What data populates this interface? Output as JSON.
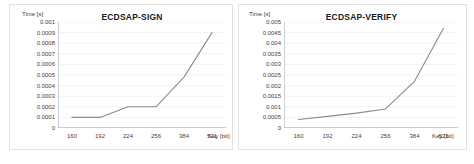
{
  "chart_data": [
    {
      "id": "ecdsap-sign",
      "type": "line",
      "title": "ECDSAP-SIGN",
      "xlabel": "Key [bit]",
      "ylabel": "Time [s]",
      "x_categories": [
        "160",
        "192",
        "224",
        "256",
        "384",
        "521"
      ],
      "values": [
        0.0001,
        0.0001,
        0.0002,
        0.0002,
        0.00048,
        0.0009
      ],
      "ylim": [
        0,
        0.001
      ],
      "y_ticks": [
        "0",
        "0.0001",
        "0.0002",
        "0.0003",
        "0.0004",
        "0.0005",
        "0.0006",
        "0.0007",
        "0.0008",
        "0.0009",
        "0.001"
      ],
      "y_tick_values": [
        0,
        0.0001,
        0.0002,
        0.0003,
        0.0004,
        0.0005,
        0.0006,
        0.0007,
        0.0008,
        0.0009,
        0.001
      ],
      "grid": true,
      "legend": "none",
      "line_color": "#8c8c8c"
    },
    {
      "id": "ecdsap-verify",
      "type": "line",
      "title": "ECDSAP-VERIFY",
      "xlabel": "Key [bit]",
      "ylabel": "Time [s]",
      "x_categories": [
        "160",
        "192",
        "224",
        "256",
        "384",
        "521"
      ],
      "values": [
        0.0004,
        0.00055,
        0.0007,
        0.0009,
        0.0022,
        0.0047
      ],
      "ylim": [
        0,
        0.005
      ],
      "y_ticks": [
        "0",
        "0.0005",
        "0.001",
        "0.0015",
        "0.002",
        "0.0025",
        "0.003",
        "0.0035",
        "0.004",
        "0.0045",
        "0.005"
      ],
      "y_tick_values": [
        0,
        0.0005,
        0.001,
        0.0015,
        0.002,
        0.0025,
        0.003,
        0.0035,
        0.004,
        0.0045,
        0.005
      ],
      "grid": true,
      "legend": "none",
      "line_color": "#8c8c8c"
    }
  ]
}
